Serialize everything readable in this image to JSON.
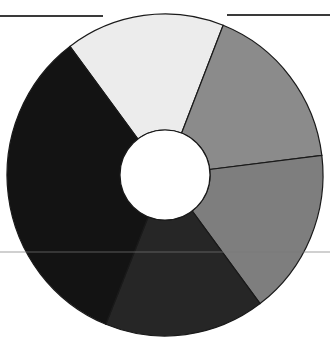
{
  "chart_data": {
    "type": "pie",
    "variant": "donut",
    "title": "",
    "legend": [],
    "center": [
      165,
      175
    ],
    "outer_radius": [
      158,
      161
    ],
    "inner_radius": 45,
    "start_angle_deg": 323,
    "slices": [
      {
        "label": "",
        "value": 58.6,
        "color": "#ececec"
      },
      {
        "label": "",
        "value": 61.4,
        "color": "#8b8b8b"
      },
      {
        "label": "",
        "value": 60.0,
        "color": "#7e7e7e"
      },
      {
        "label": "",
        "value": 59.0,
        "color": "#262626"
      },
      {
        "label": "",
        "value": 121.0,
        "color": "#131313"
      }
    ],
    "stroke": "#1a1a1a"
  },
  "decor": {
    "rules": [
      {
        "x": 0,
        "y": 15,
        "w": 103
      },
      {
        "x": 227,
        "y": 14,
        "w": 103
      }
    ],
    "scanline_y": 251
  }
}
